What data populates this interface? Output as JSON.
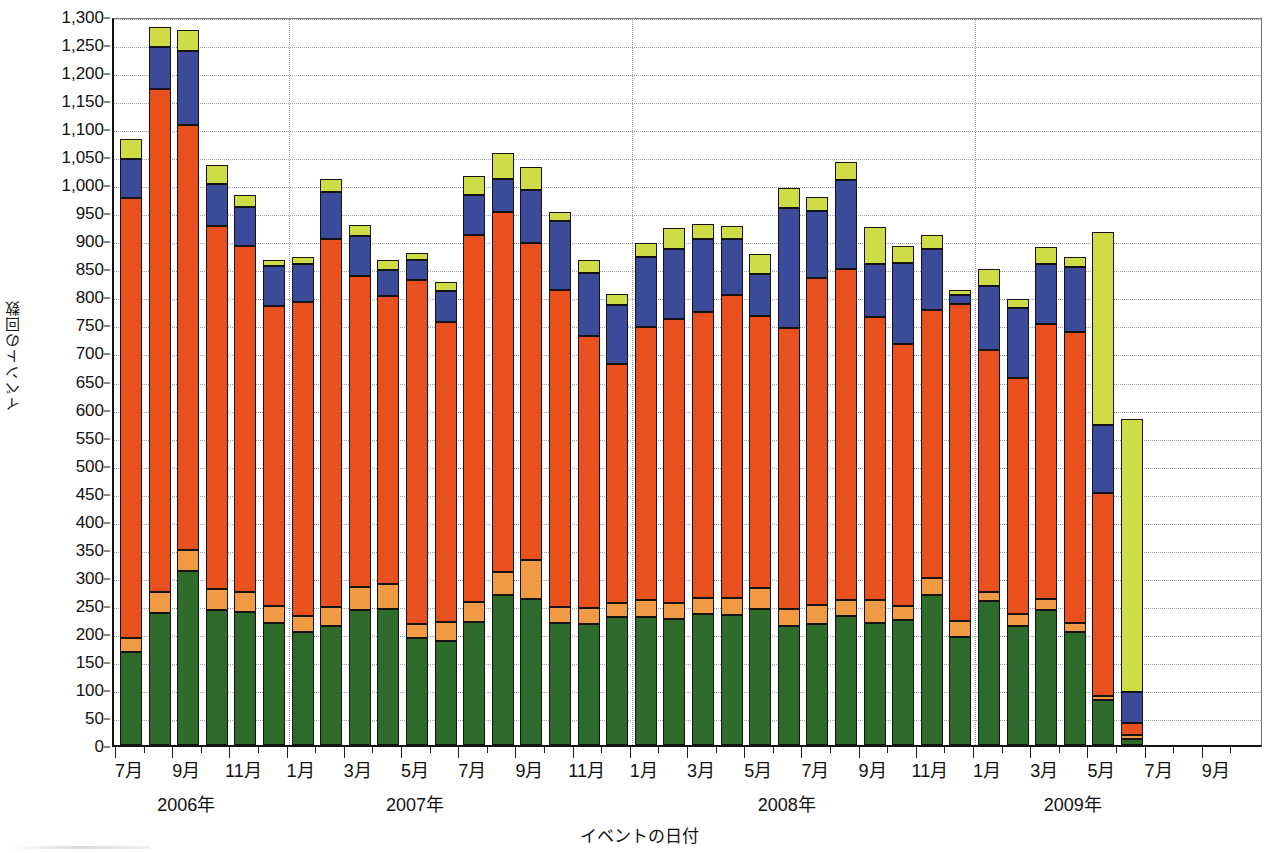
{
  "chart_data": {
    "type": "bar",
    "stacked": true,
    "title": "",
    "xlabel": "イベントの日付",
    "ylabel": "イベントの回数",
    "ylim": [
      0,
      1300
    ],
    "ytick_step": 50,
    "grid": true,
    "legend_position": "none",
    "ytick_labels": [
      "0",
      "50",
      "100",
      "150",
      "200",
      "250",
      "300",
      "350",
      "400",
      "450",
      "500",
      "550",
      "600",
      "650",
      "700",
      "750",
      "800",
      "850",
      "900",
      "950",
      "1,000",
      "1,050",
      "1,100",
      "1,150",
      "1,200",
      "1,250",
      "1,300"
    ],
    "series": [
      {
        "name": "series-green",
        "color": "#2e6b2b"
      },
      {
        "name": "series-orange",
        "color": "#f09a44"
      },
      {
        "name": "series-red",
        "color": "#e8501e"
      },
      {
        "name": "series-blue",
        "color": "#3c4a9a"
      },
      {
        "name": "series-yellow",
        "color": "#cfdc46"
      }
    ],
    "year_labels": [
      {
        "text": "2006年",
        "at_category": "2006-09"
      },
      {
        "text": "2007年",
        "at_category": "2007-05"
      },
      {
        "text": "2008年",
        "at_category": "2008-06"
      },
      {
        "text": "2009年",
        "at_category": "2009-04"
      }
    ],
    "xtick_labels": [
      "7月",
      "9月",
      "11月",
      "1月",
      "3月",
      "5月",
      "7月",
      "9月",
      "11月",
      "1月",
      "3月",
      "5月",
      "7月",
      "9月",
      "11月",
      "1月",
      "3月",
      "5月",
      "7月",
      "9月"
    ],
    "categories": [
      "2006-07",
      "2006-08",
      "2006-09",
      "2006-10",
      "2006-11",
      "2006-12",
      "2007-01",
      "2007-02",
      "2007-03",
      "2007-04",
      "2007-05",
      "2007-06",
      "2007-07",
      "2007-08",
      "2007-09",
      "2007-10",
      "2007-11",
      "2007-12",
      "2008-01",
      "2008-02",
      "2008-03",
      "2008-04",
      "2008-05",
      "2008-06",
      "2008-07",
      "2008-08",
      "2008-09",
      "2008-10",
      "2008-11",
      "2008-12",
      "2009-01",
      "2009-02",
      "2009-03",
      "2009-04",
      "2009-05",
      "2009-06",
      "2009-07",
      "2009-08",
      "2009-09"
    ],
    "points": [
      {
        "category": "2006-07",
        "green": 165,
        "orange": 25,
        "red": 785,
        "blue": 70,
        "yellow": 35,
        "total": 1080
      },
      {
        "category": "2006-08",
        "green": 235,
        "orange": 38,
        "red": 897,
        "blue": 75,
        "yellow": 35,
        "total": 1280
      },
      {
        "category": "2006-09",
        "green": 310,
        "orange": 38,
        "red": 758,
        "blue": 132,
        "yellow": 37,
        "total": 1275
      },
      {
        "category": "2006-10",
        "green": 240,
        "orange": 38,
        "red": 647,
        "blue": 75,
        "yellow": 35,
        "total": 1035
      },
      {
        "category": "2006-11",
        "green": 238,
        "orange": 35,
        "red": 617,
        "blue": 70,
        "yellow": 20,
        "total": 980
      },
      {
        "category": "2006-12",
        "green": 218,
        "orange": 30,
        "red": 535,
        "blue": 72,
        "yellow": 10,
        "total": 865
      },
      {
        "category": "2007-01",
        "green": 202,
        "orange": 28,
        "red": 560,
        "blue": 68,
        "yellow": 12,
        "total": 870
      },
      {
        "category": "2007-02",
        "green": 212,
        "orange": 35,
        "red": 655,
        "blue": 85,
        "yellow": 23,
        "total": 1010
      },
      {
        "category": "2007-03",
        "green": 240,
        "orange": 42,
        "red": 555,
        "blue": 70,
        "yellow": 20,
        "total": 927
      },
      {
        "category": "2007-04",
        "green": 243,
        "orange": 45,
        "red": 512,
        "blue": 47,
        "yellow": 18,
        "total": 865
      },
      {
        "category": "2007-05",
        "green": 190,
        "orange": 25,
        "red": 615,
        "blue": 35,
        "yellow": 13,
        "total": 878
      },
      {
        "category": "2007-06",
        "green": 185,
        "orange": 35,
        "red": 535,
        "blue": 55,
        "yellow": 15,
        "total": 825
      },
      {
        "category": "2007-07",
        "green": 220,
        "orange": 35,
        "red": 655,
        "blue": 70,
        "yellow": 35,
        "total": 1015
      },
      {
        "category": "2007-08",
        "green": 268,
        "orange": 40,
        "red": 642,
        "blue": 60,
        "yellow": 45,
        "total": 1055
      },
      {
        "category": "2007-09",
        "green": 260,
        "orange": 70,
        "red": 565,
        "blue": 95,
        "yellow": 40,
        "total": 1030
      },
      {
        "category": "2007-10",
        "green": 217,
        "orange": 30,
        "red": 565,
        "blue": 123,
        "yellow": 15,
        "total": 950
      },
      {
        "category": "2007-11",
        "green": 215,
        "orange": 30,
        "red": 485,
        "blue": 112,
        "yellow": 23,
        "total": 865
      },
      {
        "category": "2007-12",
        "green": 228,
        "orange": 25,
        "red": 427,
        "blue": 105,
        "yellow": 20,
        "total": 805
      },
      {
        "category": "2008-01",
        "green": 228,
        "orange": 30,
        "red": 487,
        "blue": 125,
        "yellow": 25,
        "total": 895
      },
      {
        "category": "2008-02",
        "green": 225,
        "orange": 28,
        "red": 507,
        "blue": 125,
        "yellow": 37,
        "total": 922
      },
      {
        "category": "2008-03",
        "green": 233,
        "orange": 30,
        "red": 510,
        "blue": 130,
        "yellow": 27,
        "total": 930
      },
      {
        "category": "2008-04",
        "green": 232,
        "orange": 30,
        "red": 540,
        "blue": 100,
        "yellow": 23,
        "total": 925
      },
      {
        "category": "2008-05",
        "green": 242,
        "orange": 38,
        "red": 485,
        "blue": 75,
        "yellow": 35,
        "total": 875
      },
      {
        "category": "2008-06",
        "green": 213,
        "orange": 30,
        "red": 500,
        "blue": 215,
        "yellow": 35,
        "total": 993
      },
      {
        "category": "2008-07",
        "green": 215,
        "orange": 35,
        "red": 583,
        "blue": 120,
        "yellow": 25,
        "total": 978
      },
      {
        "category": "2008-08",
        "green": 230,
        "orange": 28,
        "red": 590,
        "blue": 160,
        "yellow": 32,
        "total": 1040
      },
      {
        "category": "2008-09",
        "green": 218,
        "orange": 40,
        "red": 505,
        "blue": 95,
        "yellow": 65,
        "total": 923
      },
      {
        "category": "2008-10",
        "green": 223,
        "orange": 25,
        "red": 467,
        "blue": 145,
        "yellow": 30,
        "total": 890
      },
      {
        "category": "2008-11",
        "green": 267,
        "orange": 30,
        "red": 478,
        "blue": 110,
        "yellow": 25,
        "total": 910
      },
      {
        "category": "2008-12",
        "green": 192,
        "orange": 30,
        "red": 565,
        "blue": 15,
        "yellow": 10,
        "total": 812
      },
      {
        "category": "2009-01",
        "green": 257,
        "orange": 15,
        "red": 432,
        "blue": 115,
        "yellow": 30,
        "total": 849
      },
      {
        "category": "2009-02",
        "green": 213,
        "orange": 20,
        "red": 422,
        "blue": 125,
        "yellow": 15,
        "total": 795
      },
      {
        "category": "2009-03",
        "green": 240,
        "orange": 20,
        "red": 490,
        "blue": 108,
        "yellow": 30,
        "total": 888
      },
      {
        "category": "2009-04",
        "green": 202,
        "orange": 15,
        "red": 520,
        "blue": 115,
        "yellow": 18,
        "total": 870
      },
      {
        "category": "2009-05",
        "green": 80,
        "orange": 8,
        "red": 362,
        "blue": 120,
        "yellow": 345,
        "total": 915
      },
      {
        "category": "2009-06",
        "green": 10,
        "orange": 8,
        "red": 22,
        "blue": 55,
        "yellow": 487,
        "total": 582
      }
    ]
  }
}
